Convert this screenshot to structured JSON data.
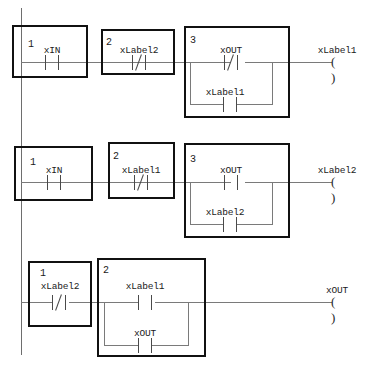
{
  "diagram": {
    "power_rail_label": "left-power-rail",
    "colors": {
      "box_border": "#111111",
      "wire": "#7a7a7a",
      "rail": "#6e6e6e",
      "text": "#1a1a1a",
      "background": "#ffffff"
    }
  },
  "rungs": [
    {
      "id": "rung-1",
      "blocks": [
        {
          "number": "1",
          "label": "xIN",
          "contact": "NO"
        },
        {
          "number": "2",
          "label": "xLabel2",
          "contact": "NC"
        },
        {
          "number": "3",
          "label": "xOUT",
          "contact": "NC",
          "branch_label": "xLabel1",
          "branch_contact": "NO"
        }
      ],
      "coil": {
        "label": "xLabel1",
        "symbol": "( )"
      }
    },
    {
      "id": "rung-2",
      "blocks": [
        {
          "number": "1",
          "label": "xIN",
          "contact": "NO"
        },
        {
          "number": "2",
          "label": "xLabel1",
          "contact": "NC"
        },
        {
          "number": "3",
          "label": "xOUT",
          "contact": "NO",
          "branch_label": "xLabel2",
          "branch_contact": "NO"
        }
      ],
      "coil": {
        "label": "xLabel2",
        "symbol": "( )"
      }
    },
    {
      "id": "rung-3",
      "blocks": [
        {
          "number": "1",
          "label": "xLabel2",
          "contact": "NC"
        },
        {
          "number": "2",
          "label": "xLabel1",
          "contact": "NO",
          "branch_label": "xOUT",
          "branch_contact": "NO"
        }
      ],
      "coil": {
        "label": "xOUT",
        "symbol": "( )"
      }
    }
  ]
}
